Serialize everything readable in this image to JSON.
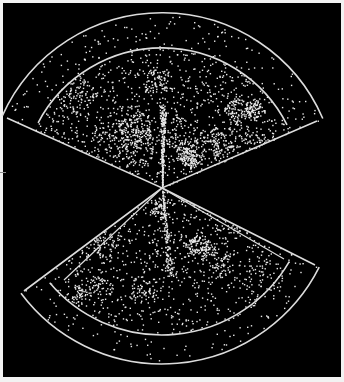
{
  "chart_data": {
    "type": "scatter",
    "title": "",
    "xlabel": "",
    "ylabel": "",
    "grid": false,
    "legend": null,
    "colors": {
      "background": "#000000",
      "points": "#e8e8e8",
      "outline": "#dcdcdc",
      "margin": "#f2f2f2"
    },
    "apex": [
      162,
      188
    ],
    "wedges": [
      {
        "name": "north-slice",
        "outer_corners": [
          [
            7,
            118
          ],
          [
            317,
            121
          ]
        ],
        "outer_arc_peak": [
          170,
          13
        ],
        "inner_arc_peak": [
          165,
          48
        ],
        "inner_arc_ends": [
          [
            45,
            125
          ],
          [
            282,
            122
          ]
        ],
        "point_count": 2300
      },
      {
        "name": "south-slice",
        "outer_corners": [
          [
            24,
            291
          ],
          [
            315,
            265
          ]
        ],
        "outer_arc_bottom": [
          163,
          364
        ],
        "inner_arc_bottom": [
          160,
          335
        ],
        "inner_corners": [
          [
            64,
            280
          ],
          [
            284,
            259
          ]
        ],
        "point_count": 1500
      }
    ]
  }
}
